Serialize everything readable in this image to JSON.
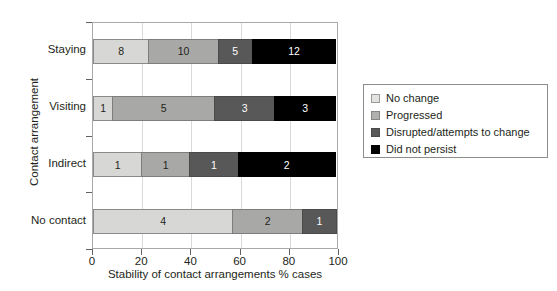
{
  "chart_data": {
    "type": "bar",
    "orientation": "horizontal",
    "stacked": true,
    "stack_mode": "percent",
    "title": "",
    "xlabel": "Stability of contact arrangements % cases",
    "ylabel": "Contact arrangement",
    "categories": [
      "Staying",
      "Visiting",
      "Indirect",
      "No contact"
    ],
    "xlim": [
      0,
      100
    ],
    "xticks": [
      0,
      20,
      40,
      60,
      80,
      100
    ],
    "xtick_labels": [
      "0",
      "20",
      "40",
      "60",
      "80",
      "100"
    ],
    "grid": true,
    "grid_axis": "x",
    "legend_position": "right",
    "series": [
      {
        "name": "No change",
        "color": "#d7d7d5",
        "values": [
          8,
          1,
          1,
          4
        ]
      },
      {
        "name": "Progressed",
        "color": "#a8a8a6",
        "values": [
          10,
          5,
          1,
          2
        ]
      },
      {
        "name": "Disrupted/attempts to change",
        "color": "#585858",
        "values": [
          5,
          3,
          1,
          1
        ]
      },
      {
        "name": "Did not persist",
        "color": "#000000",
        "values": [
          12,
          3,
          2,
          0
        ]
      }
    ],
    "row_totals": [
      35,
      12,
      5,
      7
    ],
    "rows": [
      {
        "category": "Staying",
        "total": 35,
        "segments": [
          {
            "series": "No change",
            "value": 8,
            "label": "8",
            "percent": 22.9
          },
          {
            "series": "Progressed",
            "value": 10,
            "label": "10",
            "percent": 28.6
          },
          {
            "series": "Disrupted/attempts to change",
            "value": 5,
            "label": "5",
            "percent": 14.3
          },
          {
            "series": "Did not persist",
            "value": 12,
            "label": "12",
            "percent": 34.3
          }
        ]
      },
      {
        "category": "Visiting",
        "total": 12,
        "segments": [
          {
            "series": "No change",
            "value": 1,
            "label": "1",
            "percent": 8.3
          },
          {
            "series": "Progressed",
            "value": 5,
            "label": "5",
            "percent": 41.7
          },
          {
            "series": "Disrupted/attempts to change",
            "value": 3,
            "label": "3",
            "percent": 25.0
          },
          {
            "series": "Did not persist",
            "value": 3,
            "label": "3",
            "percent": 25.0
          }
        ]
      },
      {
        "category": "Indirect",
        "total": 5,
        "segments": [
          {
            "series": "No change",
            "value": 1,
            "label": "1",
            "percent": 20.0
          },
          {
            "series": "Progressed",
            "value": 1,
            "label": "1",
            "percent": 20.0
          },
          {
            "series": "Disrupted/attempts to change",
            "value": 1,
            "label": "1",
            "percent": 20.0
          },
          {
            "series": "Did not persist",
            "value": 2,
            "label": "2",
            "percent": 40.0
          }
        ]
      },
      {
        "category": "No contact",
        "total": 7,
        "segments": [
          {
            "series": "No change",
            "value": 4,
            "label": "4",
            "percent": 57.1
          },
          {
            "series": "Progressed",
            "value": 2,
            "label": "2",
            "percent": 28.6
          },
          {
            "series": "Disrupted/attempts to change",
            "value": 1,
            "label": "1",
            "percent": 14.3
          }
        ]
      }
    ]
  },
  "axes": {
    "y_title": "Contact arrangement",
    "x_title": "Stability of contact arrangements % cases",
    "y_categories": [
      "Staying",
      "Visiting",
      "Indirect",
      "No contact"
    ],
    "x_tick_labels": [
      "0",
      "20",
      "40",
      "60",
      "80",
      "100"
    ]
  },
  "legend": {
    "items": [
      {
        "label": "No change",
        "swatch": "s0"
      },
      {
        "label": "Progressed",
        "swatch": "s1"
      },
      {
        "label": "Disrupted/attempts to change",
        "swatch": "s2"
      },
      {
        "label": "Did not persist",
        "swatch": "s3"
      }
    ]
  },
  "title": {
    "text": "",
    "note": "cropped above image top edge"
  }
}
